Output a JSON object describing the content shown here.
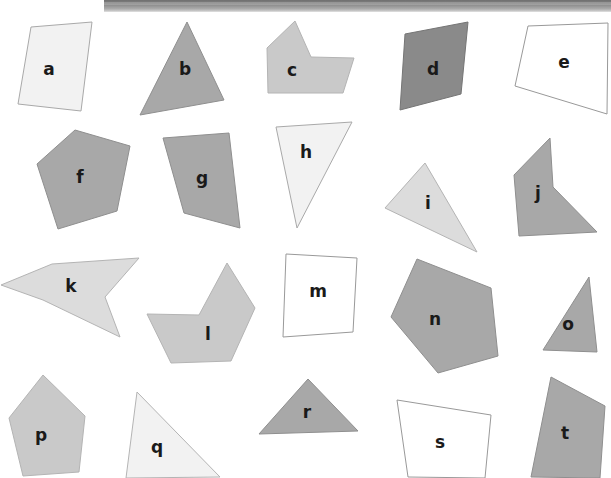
{
  "canvas": {
    "width": 611,
    "height": 478,
    "background": "#ffffff"
  },
  "topbar": {
    "name": "window-title-bar",
    "visible": true
  },
  "palette": {
    "white": "#ffffff",
    "very_light_gray": "#f2f2f2",
    "light_gray": "#dcdcdc",
    "mid_light_gray": "#c9c9c9",
    "mid_gray": "#a8a8a8",
    "dark_gray": "#8a8a8a",
    "outline": "#999999",
    "label_color": "#1a1a1a"
  },
  "shapes": [
    {
      "id": "a",
      "label": "a",
      "fill": "#f2f2f2",
      "stroke": "#a9a9a9",
      "points": "31,27 92,22 81,111 18,104",
      "label_x": 49,
      "label_y": 70
    },
    {
      "id": "b",
      "label": "b",
      "fill": "#a8a8a8",
      "stroke": "#8f8f8f",
      "points": "187,22 224,100 140,115",
      "label_x": 185,
      "label_y": 70
    },
    {
      "id": "c",
      "label": "c",
      "fill": "#c9c9c9",
      "stroke": "#b4b4b4",
      "points": "295,21 267,48 268,93 343,93 354,58 311,57",
      "label_x": 292,
      "label_y": 71
    },
    {
      "id": "d",
      "label": "d",
      "fill": "#8a8a8a",
      "stroke": "#757575",
      "points": "405,34 468,22 461,94 400,110",
      "label_x": 433,
      "label_y": 70
    },
    {
      "id": "e",
      "label": "e",
      "fill": "#ffffff",
      "stroke": "#999999",
      "points": "528,26 608,23 607,114 515,86",
      "label_x": 564,
      "label_y": 63
    },
    {
      "id": "f",
      "label": "f",
      "fill": "#a8a8a8",
      "stroke": "#8f8f8f",
      "points": "75,130 130,146 117,211 58,229 37,164",
      "label_x": 80,
      "label_y": 178
    },
    {
      "id": "g",
      "label": "g",
      "fill": "#a8a8a8",
      "stroke": "#8f8f8f",
      "points": "163,138 229,133 240,228 184,213",
      "label_x": 202,
      "label_y": 179
    },
    {
      "id": "h",
      "label": "h",
      "fill": "#f2f2f2",
      "stroke": "#a9a9a9",
      "points": "276,127 352,122 297,228",
      "label_x": 306,
      "label_y": 153
    },
    {
      "id": "i",
      "label": "i",
      "fill": "#dcdcdc",
      "stroke": "#b4b4b4",
      "points": "425,163 477,252 385,208",
      "label_x": 428,
      "label_y": 204
    },
    {
      "id": "j",
      "label": "j",
      "fill": "#a8a8a8",
      "stroke": "#8f8f8f",
      "points": "550,138 553,187 597,232 519,236 514,175",
      "label_x": 538,
      "label_y": 194
    },
    {
      "id": "k",
      "label": "k",
      "fill": "#dcdcdc",
      "stroke": "#b4b4b4",
      "points": "52,264 139,258 105,297 120,337 43,300 1,285",
      "label_x": 71,
      "label_y": 287
    },
    {
      "id": "l",
      "label": "l",
      "fill": "#c9c9c9",
      "stroke": "#b4b4b4",
      "points": "227,263 255,308 231,361 171,363 147,314 199,315",
      "label_x": 208,
      "label_y": 335
    },
    {
      "id": "m",
      "label": "m",
      "fill": "#ffffff",
      "stroke": "#999999",
      "points": "286,254 357,258 353,332 283,337",
      "label_x": 318,
      "label_y": 292
    },
    {
      "id": "n",
      "label": "n",
      "fill": "#a8a8a8",
      "stroke": "#8f8f8f",
      "points": "417,259 491,288 498,356 438,373 391,317",
      "label_x": 435,
      "label_y": 320
    },
    {
      "id": "o",
      "label": "o",
      "fill": "#a8a8a8",
      "stroke": "#8f8f8f",
      "points": "589,277 597,352 543,350",
      "label_x": 568,
      "label_y": 325
    },
    {
      "id": "p",
      "label": "p",
      "fill": "#c9c9c9",
      "stroke": "#b4b4b4",
      "points": "43,375 85,416 79,472 23,476 9,418",
      "label_x": 41,
      "label_y": 436
    },
    {
      "id": "q",
      "label": "q",
      "fill": "#f2f2f2",
      "stroke": "#b4b4b4",
      "points": "137,392 220,477 126,478",
      "label_x": 157,
      "label_y": 448
    },
    {
      "id": "r",
      "label": "r",
      "fill": "#a8a8a8",
      "stroke": "#8f8f8f",
      "points": "308,379 358,431 259,434",
      "label_x": 307,
      "label_y": 413
    },
    {
      "id": "s",
      "label": "s",
      "fill": "#ffffff",
      "stroke": "#999999",
      "points": "397,400 491,415 485,478 408,477",
      "label_x": 440,
      "label_y": 443
    },
    {
      "id": "t",
      "label": "t",
      "fill": "#a8a8a8",
      "stroke": "#8f8f8f",
      "points": "551,377 605,406 600,478 531,477",
      "label_x": 565,
      "label_y": 434
    }
  ]
}
